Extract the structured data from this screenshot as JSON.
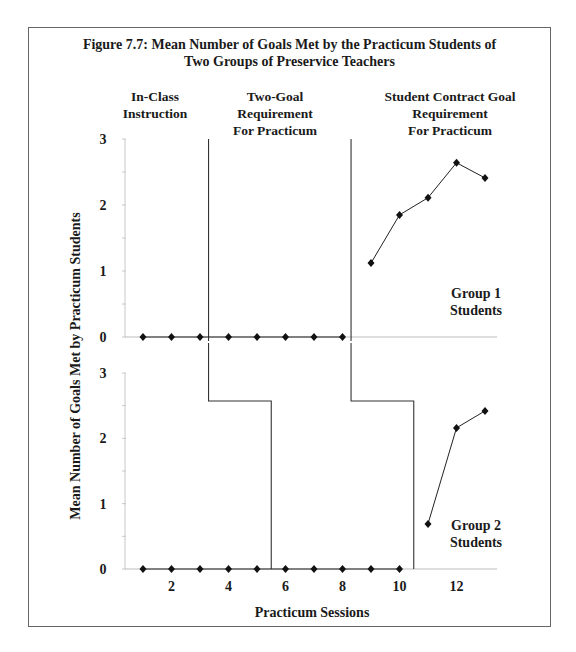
{
  "figure": {
    "title_line1": "Figure 7.7: Mean Number of Goals Met by the Practicum Students of",
    "title_line2": "Two Groups of Preservice Teachers",
    "phases": [
      {
        "line1": "In-Class",
        "line2": "Instruction",
        "line3": ""
      },
      {
        "line1": "Two-Goal",
        "line2": "Requirement",
        "line3": "For Practicum"
      },
      {
        "line1": "Student Contract Goal",
        "line2": "Requirement",
        "line3": "For Practicum"
      }
    ],
    "ylabel": "Mean Number of Goals Met by Practicum Students",
    "xlabel": "Practicum Sessions",
    "group1_label_line1": "Group 1",
    "group1_label_line2": "Students",
    "group2_label_line1": "Group 2",
    "group2_label_line2": "Students"
  },
  "chart_data": {
    "type": "line",
    "title": "Figure 7.7: Mean Number of Goals Met by the Practicum Students of Two Groups of Preservice Teachers",
    "xlabel": "Practicum Sessions",
    "ylabel": "Mean Number of Goals Met by Practicum Students",
    "x_ticks": [
      2,
      4,
      6,
      8,
      10,
      12
    ],
    "y_ticks": [
      0,
      1,
      2,
      3
    ],
    "ylim": [
      0,
      3
    ],
    "xlim": [
      0,
      13.5
    ],
    "grid": false,
    "phases": [
      "In-Class Instruction",
      "Two-Goal Requirement For Practicum",
      "Student Contract Goal Requirement For Practicum"
    ],
    "panels": [
      {
        "name": "Group 1 Students",
        "phase_change_after_session": [
          3.3,
          8.3
        ],
        "segments": [
          {
            "x": [
              1,
              2,
              3,
              4,
              5,
              6,
              7,
              8
            ],
            "y": [
              0,
              0,
              0,
              0,
              0,
              0,
              0,
              0
            ]
          },
          {
            "x": [
              9,
              10,
              11,
              12,
              13
            ],
            "y": [
              1.12,
              1.85,
              2.11,
              2.64,
              2.41
            ]
          }
        ]
      },
      {
        "name": "Group 2 Students",
        "phase_change_after_session": [
          5.5,
          10.5
        ],
        "segments": [
          {
            "x": [
              1,
              2,
              3,
              4,
              5,
              6,
              7,
              8,
              9,
              10
            ],
            "y": [
              0,
              0,
              0,
              0,
              0,
              0,
              0,
              0,
              0,
              0
            ]
          },
          {
            "x": [
              11,
              12,
              13
            ],
            "y": [
              0.69,
              2.16,
              2.42
            ]
          }
        ]
      }
    ]
  }
}
